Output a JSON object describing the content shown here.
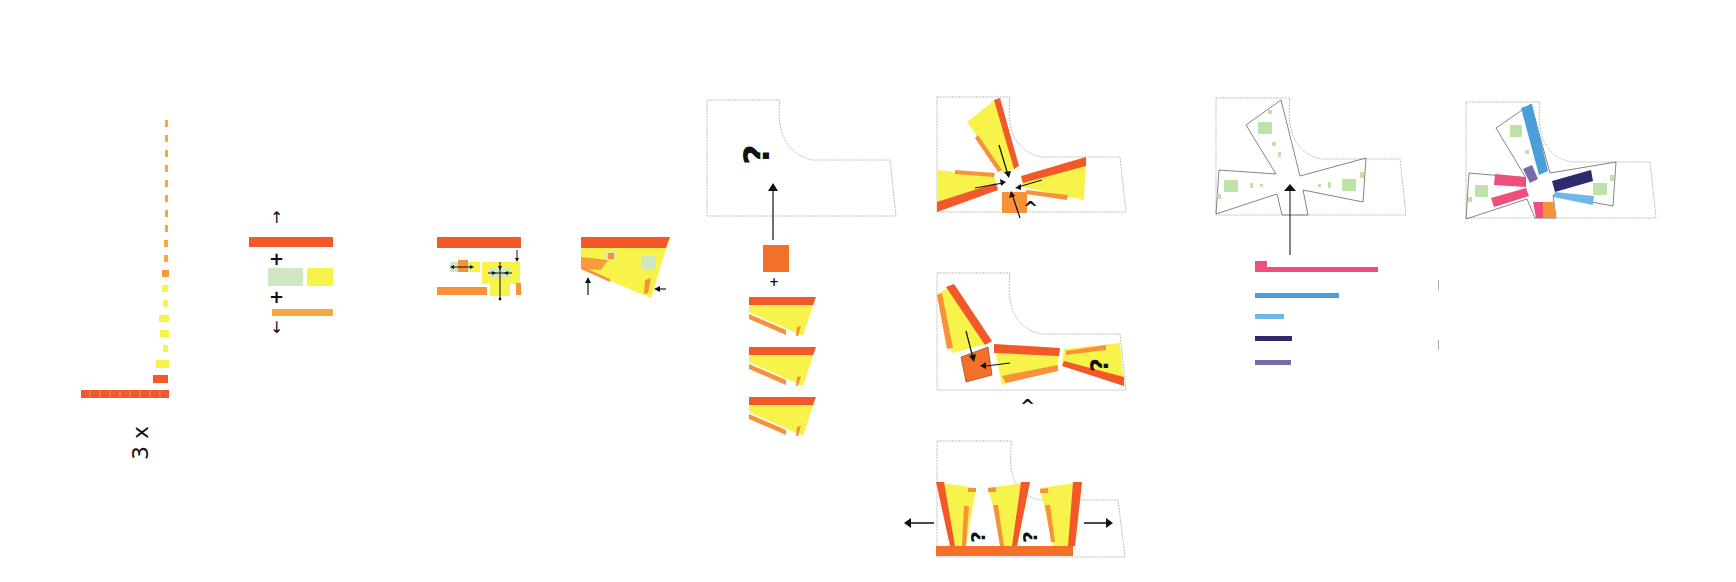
{
  "colors": {
    "red_orange": "#f2582a",
    "orange": "#f7923a",
    "dark_orange": "#e86a1e",
    "yellow": "#f8f34a",
    "pale_green": "#cfe8c3",
    "green": "#b5dd9b",
    "pink": "#ef4f7c",
    "blue": "#4a9fd8",
    "light_blue": "#6fb8e6",
    "navy": "#2e2a6e",
    "purple": "#7b6aa8",
    "outline": "#b8b8b8",
    "arrow": "#111111"
  },
  "step1": {
    "multiplier_label": "3 x",
    "bars": [
      {
        "color": "orange",
        "length": 2
      },
      {
        "color": "orange",
        "length": 2
      },
      {
        "color": "orange",
        "length": 2
      },
      {
        "color": "orange",
        "length": 2
      },
      {
        "color": "orange",
        "length": 2
      },
      {
        "color": "orange",
        "length": 2
      },
      {
        "color": "orange",
        "length": 2
      },
      {
        "color": "orange",
        "length": 2
      },
      {
        "color": "orange",
        "length": 3
      },
      {
        "color": "orange",
        "length": 3
      },
      {
        "color": "orange",
        "length": 4
      },
      {
        "color": "yellow",
        "length": 4
      },
      {
        "color": "yellow",
        "length": 3
      },
      {
        "color": "yellow",
        "length": 5
      },
      {
        "color": "yellow",
        "length": 5
      },
      {
        "color": "yellow",
        "length": 3
      },
      {
        "color": "yellow",
        "length": 7
      },
      {
        "color": "red_orange",
        "length": 8
      },
      {
        "color": "red_orange",
        "length": 46
      }
    ]
  },
  "step2": {
    "plus_1": "+",
    "plus_2": "+",
    "arrow_up": "↑",
    "arrow_down": "↓"
  },
  "step3": {
    "description": "program arrangement with circulation arrows"
  },
  "step4": {
    "description": "wedge-shaped wing"
  },
  "step5": {
    "question_mark": "?",
    "plus": "+",
    "wing_count": 3
  },
  "options": [
    {
      "label": "radial",
      "marker": "^"
    },
    {
      "label": "linear",
      "marker": "^",
      "question_mark": "?"
    },
    {
      "label": "parallel",
      "question_marks": [
        "?",
        "?"
      ]
    }
  ],
  "step7": {
    "legend_bars": [
      {
        "color": "pink",
        "length": 110
      },
      {
        "color": "blue",
        "length": 74
      },
      {
        "color": "light_blue",
        "length": 28
      },
      {
        "color": "navy",
        "length": 35
      },
      {
        "color": "purple",
        "length": 34
      }
    ]
  }
}
